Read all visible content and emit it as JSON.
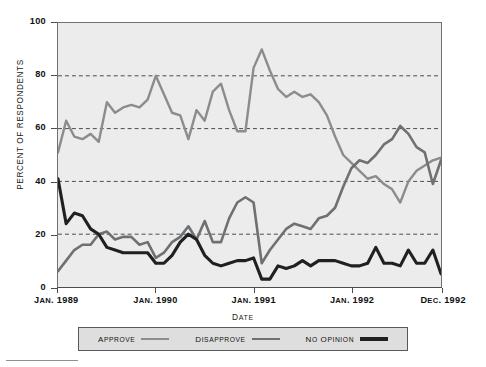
{
  "chart_data": {
    "type": "line",
    "title": "",
    "xlabel": "Date",
    "ylabel": "Percent of Respondents",
    "ylim": [
      0,
      100
    ],
    "yticks": [
      0,
      20,
      40,
      60,
      80,
      100
    ],
    "gridlines": [
      20,
      40,
      60,
      80
    ],
    "grid": true,
    "legend_position": "bottom",
    "x_tick_labels": [
      "Jan. 1989",
      "Jan. 1990",
      "Jan. 1991",
      "Jan. 1992",
      "Dec. 1992"
    ],
    "x_tick_values": [
      0,
      12,
      24,
      36,
      47
    ],
    "x": [
      "Jan. 1989",
      "Feb. 1989",
      "Mar. 1989",
      "Apr. 1989",
      "May 1989",
      "Jun. 1989",
      "Jul. 1989",
      "Aug. 1989",
      "Sep. 1989",
      "Oct. 1989",
      "Nov. 1989",
      "Dec. 1989",
      "Jan. 1990",
      "Feb. 1990",
      "Mar. 1990",
      "Apr. 1990",
      "May 1990",
      "Jun. 1990",
      "Jul. 1990",
      "Aug. 1990",
      "Sep. 1990",
      "Oct. 1990",
      "Nov. 1990",
      "Dec. 1990",
      "Jan. 1991",
      "Feb. 1991",
      "Mar. 1991",
      "Apr. 1991",
      "May 1991",
      "Jun. 1991",
      "Jul. 1991",
      "Aug. 1991",
      "Sep. 1991",
      "Oct. 1991",
      "Nov. 1991",
      "Dec. 1991",
      "Jan. 1992",
      "Feb. 1992",
      "Mar. 1992",
      "Apr. 1992",
      "May 1992",
      "Jun. 1992",
      "Jul. 1992",
      "Aug. 1992",
      "Sep. 1992",
      "Oct. 1992",
      "Nov. 1992",
      "Dec. 1992"
    ],
    "series": [
      {
        "name": "Approve",
        "color": "#8a8c8e",
        "values": [
          51,
          63,
          57,
          56,
          58,
          55,
          70,
          66,
          68,
          69,
          68,
          71,
          80,
          73,
          66,
          65,
          56,
          67,
          63,
          74,
          77,
          67,
          59,
          59,
          83,
          90,
          82,
          75,
          72,
          74,
          72,
          73,
          70,
          65,
          57,
          50,
          47,
          44,
          41,
          42,
          39,
          37,
          32,
          40,
          44,
          46,
          48,
          49
        ]
      },
      {
        "name": "Disapprove",
        "color": "#6e7072",
        "values": [
          6,
          10,
          14,
          16,
          16,
          20,
          21,
          18,
          19,
          19,
          16,
          17,
          11,
          13,
          17,
          19,
          23,
          18,
          25,
          17,
          17,
          26,
          32,
          34,
          32,
          9,
          14,
          18,
          22,
          24,
          23,
          22,
          26,
          27,
          30,
          38,
          45,
          48,
          47,
          50,
          54,
          56,
          61,
          58,
          53,
          51,
          39,
          48
        ]
      },
      {
        "name": "No opinion",
        "color": "#1e2021",
        "values": [
          41,
          24,
          28,
          27,
          22,
          20,
          15,
          14,
          13,
          13,
          13,
          13,
          9,
          9,
          12,
          17,
          20,
          18,
          12,
          9,
          8,
          9,
          10,
          10,
          11,
          3,
          3,
          8,
          7,
          8,
          10,
          8,
          10,
          10,
          10,
          9,
          8,
          8,
          9,
          15,
          9,
          9,
          8,
          14,
          9,
          9,
          14,
          5
        ]
      }
    ]
  },
  "axes": {
    "y_title": "Percent of Respondents",
    "y_ticks": [
      "100",
      "80",
      "60",
      "40",
      "20",
      "0"
    ],
    "x_title": "Date",
    "x_ticks": [
      "Jan. 1989",
      "Jan. 1990",
      "Jan. 1991",
      "Jan. 1992",
      "Dec. 1992"
    ]
  },
  "legend": {
    "items": [
      {
        "label": "Approve",
        "color": "#8a8c8e",
        "thickness": 2.1
      },
      {
        "label": "Disapprove",
        "color": "#6e7072",
        "thickness": 2.8
      },
      {
        "label": "No opinion",
        "color": "#1e2021",
        "thickness": 3.4
      }
    ]
  },
  "style": {
    "plot_background": "#ececed",
    "page_background": "#ffffff",
    "axis_color": "#4a4c4e",
    "grid_color": "#4a4c4e",
    "legend_background": "#dedede"
  }
}
